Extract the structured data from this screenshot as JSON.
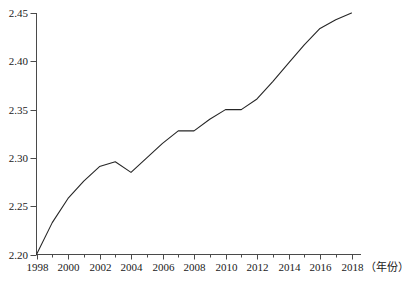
{
  "chart_data": {
    "type": "line",
    "title": "",
    "subtitle": "",
    "xlabel": "（年份）",
    "ylabel": "",
    "xlim": [
      1998,
      2018
    ],
    "ylim": [
      2.2,
      2.45
    ],
    "grid": false,
    "legend": null,
    "legend_position": "none",
    "line_color": "#262626",
    "line_width": 1.1,
    "markers": false,
    "x_major_ticks": [
      1998,
      2000,
      2002,
      2004,
      2006,
      2008,
      2010,
      2012,
      2014,
      2016,
      2018
    ],
    "x_major_tick_labels": [
      "1998",
      "2000",
      "2002",
      "2004",
      "2006",
      "2008",
      "2010",
      "2012",
      "2014",
      "2016",
      "2018"
    ],
    "x_minor_ticks": [
      1999,
      2001,
      2003,
      2005,
      2007,
      2009,
      2011,
      2013,
      2015,
      2017
    ],
    "y_ticks": [
      2.2,
      2.25,
      2.3,
      2.35,
      2.4,
      2.45
    ],
    "y_tick_labels": [
      "2.20",
      "2.25",
      "2.30",
      "2.35",
      "2.40",
      "2.45"
    ],
    "x": [
      1998,
      1999,
      2000,
      2001,
      2002,
      2003,
      2004,
      2005,
      2006,
      2007,
      2008,
      2009,
      2010,
      2011,
      2012,
      2013,
      2014,
      2015,
      2016,
      2017,
      2018
    ],
    "values": [
      2.2,
      2.233,
      2.258,
      2.276,
      2.291,
      2.296,
      2.285,
      2.3,
      2.315,
      2.328,
      2.328,
      2.34,
      2.35,
      2.35,
      2.361,
      2.379,
      2.398,
      2.417,
      2.434,
      2.443,
      2.45
    ],
    "series": [
      {
        "name": "",
        "values": [
          2.2,
          2.233,
          2.258,
          2.276,
          2.291,
          2.296,
          2.285,
          2.3,
          2.315,
          2.328,
          2.328,
          2.34,
          2.35,
          2.35,
          2.361,
          2.379,
          2.398,
          2.417,
          2.434,
          2.443,
          2.45
        ]
      }
    ]
  },
  "axes": {
    "axis_color": "#4a4a4a",
    "tick_color": "#4a4a4a"
  }
}
